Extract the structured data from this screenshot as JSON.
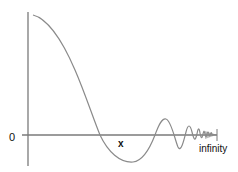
{
  "diagram": {
    "labels": {
      "origin": "0",
      "x_marker": "x",
      "end": "infinity"
    },
    "colors": {
      "axis": "#7a7a7a",
      "curve": "#8a8a8a",
      "text": "#111111",
      "background": "#ffffff"
    }
  }
}
